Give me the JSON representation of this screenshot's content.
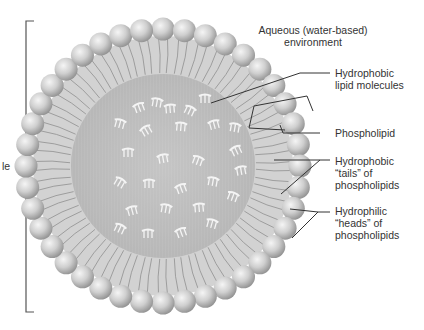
{
  "diagram": {
    "colors": {
      "background": "#ffffff",
      "head_light": "#f2f2f2",
      "head_mid": "#c8c8c8",
      "head_dark": "#8e8e8e",
      "tail_region": "#cfcfcf",
      "core": "#b9b9b9",
      "core_light": "#c8c8c8",
      "lipid_glyph": "#f4f4f4",
      "leader_line": "#333333",
      "text": "#333333"
    },
    "geometry": {
      "center": [
        163,
        166
      ],
      "head_ring_radius": 137,
      "head_radius": 11.5,
      "head_count": 40,
      "core_radius": 92
    },
    "labels": {
      "environment": [
        "Aqueous (water-based)",
        "environment"
      ],
      "lipid_molecules": [
        "Hydrophobic",
        "lipid molecules"
      ],
      "phospholipid": [
        "Phospholipid"
      ],
      "tails": [
        "Hydrophobic",
        "“tails” of",
        "phospholipids"
      ],
      "heads": [
        "Hydrophilic",
        "“heads” of",
        "phospholipids"
      ],
      "left_partial": [
        "le"
      ]
    },
    "lipid_positions": [
      [
        139,
        107,
        -20
      ],
      [
        157,
        102,
        10
      ],
      [
        170,
        108,
        -5
      ],
      [
        190,
        110,
        25
      ],
      [
        205,
        98,
        0
      ],
      [
        120,
        123,
        15
      ],
      [
        146,
        130,
        -30
      ],
      [
        181,
        126,
        5
      ],
      [
        214,
        124,
        -15
      ],
      [
        235,
        127,
        10
      ],
      [
        128,
        152,
        0
      ],
      [
        163,
        158,
        -10
      ],
      [
        198,
        160,
        20
      ],
      [
        236,
        150,
        -25
      ],
      [
        120,
        182,
        30
      ],
      [
        149,
        183,
        0
      ],
      [
        181,
        188,
        -20
      ],
      [
        213,
        181,
        10
      ],
      [
        132,
        210,
        -15
      ],
      [
        166,
        208,
        10
      ],
      [
        199,
        207,
        -5
      ],
      [
        233,
        196,
        20
      ],
      [
        148,
        233,
        0
      ],
      [
        181,
        232,
        -20
      ],
      [
        212,
        223,
        15
      ],
      [
        120,
        228,
        25
      ],
      [
        241,
        170,
        -10
      ]
    ]
  }
}
